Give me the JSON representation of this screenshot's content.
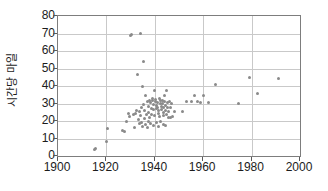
{
  "chart_data": {
    "type": "scatter",
    "title": "",
    "xlabel": "",
    "ylabel": "시간당 마일",
    "xlim": [
      1900,
      2000
    ],
    "ylim": [
      0,
      80
    ],
    "xticks": [
      1900,
      1920,
      1940,
      1960,
      1980,
      2000
    ],
    "yticks": [
      0,
      10,
      20,
      30,
      40,
      50,
      60,
      70,
      80
    ],
    "grid": true,
    "legend": null,
    "marker_color": "#8a8a8a",
    "axis_color": "#7d7d7d",
    "grid_color": "#c9c9c9",
    "points": [
      [
        1915,
        3.5
      ],
      [
        1915.6,
        4.2
      ],
      [
        1920,
        8.2
      ],
      [
        1920.5,
        16.0
      ],
      [
        1926.5,
        14.5
      ],
      [
        1927.5,
        14.0
      ],
      [
        1928.5,
        19.5
      ],
      [
        1929,
        24.5
      ],
      [
        1929.5,
        22.5
      ],
      [
        1930,
        69.0
      ],
      [
        1930.4,
        69.2
      ],
      [
        1931,
        23.5
      ],
      [
        1931.5,
        16.5
      ],
      [
        1932,
        24.5
      ],
      [
        1932.5,
        26.0
      ],
      [
        1933,
        46.5
      ],
      [
        1933.2,
        21.0
      ],
      [
        1933.6,
        18.5
      ],
      [
        1934,
        70.2
      ],
      [
        1934.2,
        23.0
      ],
      [
        1934.5,
        19.0
      ],
      [
        1934.8,
        17.0
      ],
      [
        1935,
        40.0
      ],
      [
        1935.3,
        54.0
      ],
      [
        1935.6,
        26.0
      ],
      [
        1935.9,
        21.5
      ],
      [
        1936,
        34.5
      ],
      [
        1936.4,
        24.0
      ],
      [
        1936.8,
        16.5
      ],
      [
        1937,
        31.0
      ],
      [
        1937.2,
        28.5
      ],
      [
        1937.5,
        25.0
      ],
      [
        1937.8,
        22.0
      ],
      [
        1938,
        32.0
      ],
      [
        1938.2,
        30.5
      ],
      [
        1938.5,
        27.0
      ],
      [
        1938.8,
        24.0
      ],
      [
        1939,
        33.0
      ],
      [
        1939.2,
        31.5
      ],
      [
        1939.4,
        29.5
      ],
      [
        1939.6,
        26.5
      ],
      [
        1939.8,
        23.0
      ],
      [
        1940,
        37.5
      ],
      [
        1940.2,
        32.5
      ],
      [
        1940.4,
        31.0
      ],
      [
        1940.6,
        29.0
      ],
      [
        1940.8,
        27.0
      ],
      [
        1941,
        30.5
      ],
      [
        1941.2,
        28.0
      ],
      [
        1941.4,
        26.0
      ],
      [
        1941.6,
        24.5
      ],
      [
        1941.8,
        22.5
      ],
      [
        1942,
        33.0
      ],
      [
        1942.2,
        31.5
      ],
      [
        1942.4,
        30.0
      ],
      [
        1942.6,
        28.5
      ],
      [
        1942.8,
        26.5
      ],
      [
        1943,
        32.0
      ],
      [
        1943.2,
        30.0
      ],
      [
        1943.4,
        27.5
      ],
      [
        1943.6,
        25.0
      ],
      [
        1943.8,
        23.0
      ],
      [
        1944,
        34.5
      ],
      [
        1944.2,
        31.0
      ],
      [
        1944.4,
        29.0
      ],
      [
        1944.6,
        26.0
      ],
      [
        1944.8,
        23.5
      ],
      [
        1945,
        37.5
      ],
      [
        1945.2,
        30.5
      ],
      [
        1945.4,
        28.0
      ],
      [
        1945.6,
        25.5
      ],
      [
        1945.8,
        22.0
      ],
      [
        1946,
        31.0
      ],
      [
        1946.3,
        27.5
      ],
      [
        1946.6,
        22.0
      ],
      [
        1947,
        30.0
      ],
      [
        1947.5,
        22.5
      ],
      [
        1948,
        25.5
      ],
      [
        1936.2,
        18.0
      ],
      [
        1937.4,
        19.5
      ],
      [
        1938.4,
        18.5
      ],
      [
        1939.5,
        17.5
      ],
      [
        1940.5,
        19.0
      ],
      [
        1941.5,
        17.0
      ],
      [
        1942.5,
        20.0
      ],
      [
        1943.5,
        18.0
      ],
      [
        1944.5,
        17.5
      ],
      [
        1935.5,
        29.5
      ],
      [
        1934.6,
        27.5
      ],
      [
        1933.8,
        25.5
      ],
      [
        1951.5,
        25.5
      ],
      [
        1953,
        31.0
      ],
      [
        1955,
        31.0
      ],
      [
        1956.5,
        34.5
      ],
      [
        1957.5,
        31.0
      ],
      [
        1959,
        30.5
      ],
      [
        1960,
        34.5
      ],
      [
        1962,
        30.5
      ],
      [
        1965,
        41.0
      ],
      [
        1974.5,
        30.0
      ],
      [
        1979,
        45.0
      ],
      [
        1982.5,
        35.5
      ],
      [
        1991,
        44.3
      ]
    ]
  }
}
